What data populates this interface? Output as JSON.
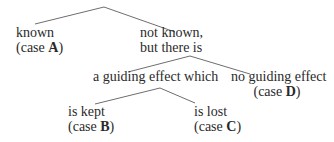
{
  "diagram": {
    "type": "decision-tree",
    "nodes": {
      "known": {
        "label": "known",
        "case_prefix": "(case ",
        "case_letter": "A",
        "case_suffix": ")"
      },
      "not_known": {
        "line1": "not known,",
        "line2": "but there is"
      },
      "guiding_effect": {
        "label": "a guiding effect which"
      },
      "no_guiding_effect": {
        "label": "no guiding effect",
        "case_prefix": "(case ",
        "case_letter": "D",
        "case_suffix": ")"
      },
      "is_kept": {
        "label": "is kept",
        "case_prefix": "(case ",
        "case_letter": "B",
        "case_suffix": ")"
      },
      "is_lost": {
        "label": "is lost",
        "case_prefix": "(case ",
        "case_letter": "C",
        "case_suffix": ")"
      }
    },
    "edges": [
      {
        "from": "root",
        "to": "known",
        "x1": 104,
        "y1": 7,
        "x2": 35,
        "y2": 24
      },
      {
        "from": "root",
        "to": "not_known",
        "x1": 104,
        "y1": 7,
        "x2": 175,
        "y2": 32
      },
      {
        "from": "not_known",
        "to": "guiding_effect",
        "x1": 190,
        "y1": 56,
        "x2": 128,
        "y2": 72
      },
      {
        "from": "not_known",
        "to": "no_guiding_effect",
        "x1": 190,
        "y1": 56,
        "x2": 250,
        "y2": 74
      },
      {
        "from": "guiding_effect",
        "to": "is_kept",
        "x1": 160,
        "y1": 88,
        "x2": 95,
        "y2": 104
      },
      {
        "from": "guiding_effect",
        "to": "is_lost",
        "x1": 160,
        "y1": 88,
        "x2": 195,
        "y2": 103
      }
    ]
  }
}
